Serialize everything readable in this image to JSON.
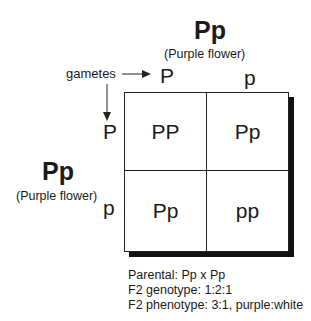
{
  "top_parent": {
    "genotype": "Pp",
    "phenotype": "(Purple flower)"
  },
  "left_parent": {
    "genotype": "Pp",
    "phenotype": "(Purple flower)"
  },
  "gametes_label": "gametes",
  "top_gametes": [
    "P",
    "p"
  ],
  "left_gametes": [
    "P",
    "p"
  ],
  "grid": {
    "rows": [
      [
        "PP",
        "Pp"
      ],
      [
        "Pp",
        "pp"
      ]
    ]
  },
  "summary": {
    "parental": "Parental: Pp x Pp",
    "genotype": "F2 genotype: 1:2:1",
    "phenotype": "F2 phenotype: 3:1, purple:white"
  }
}
